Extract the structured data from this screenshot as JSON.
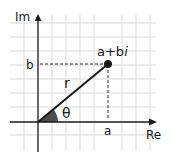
{
  "diagram": {
    "axes": {
      "imaginary_label": "Im",
      "real_label": "Re"
    },
    "point": {
      "label": "a+bi",
      "label_main": "a+b",
      "label_italic": "i"
    },
    "projections": {
      "real_value_label": "a",
      "imag_value_label": "b"
    },
    "modulus_label": "r",
    "angle_label": "θ",
    "colors": {
      "grid": "#d9d9d9",
      "axis": "#1a1a1a",
      "vector": "#1a1a1a",
      "angle_fill": "#4d4d4d",
      "dashed": "#333333"
    }
  }
}
